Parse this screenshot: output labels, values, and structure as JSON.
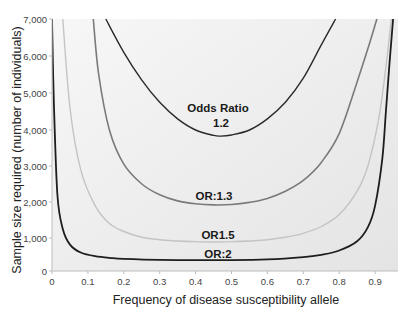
{
  "chart_data": {
    "type": "line",
    "title": "",
    "xlabel": "Frequency of disease susceptibility allele",
    "ylabel": "Sample size required (number of individuals)",
    "xlim": [
      0,
      1.0
    ],
    "ylim": [
      0,
      7000
    ],
    "x_ticks": [
      "0",
      "0.1",
      "0.2",
      "0.3",
      "0.4",
      "0.5",
      "0.6",
      "0.7",
      "0.8",
      "0.9"
    ],
    "y_ticks": [
      "0",
      "1,000",
      "2,000",
      "3,000",
      "4,000",
      "5,000",
      "6,000",
      "7,000"
    ],
    "grid": false,
    "legend": "inline labels",
    "background": "light gray gradient inside plot area",
    "series": [
      {
        "name": "Odds Ratio 1.2",
        "label_lines": [
          "Odds Ratio",
          "1.2"
        ],
        "color": "#2a2a2a",
        "x": [
          0.15,
          0.2,
          0.25,
          0.3,
          0.35,
          0.4,
          0.45,
          0.47,
          0.5,
          0.55,
          0.6,
          0.65,
          0.7,
          0.75,
          0.79
        ],
        "y": [
          7000,
          6100,
          5350,
          4750,
          4300,
          4000,
          3850,
          3830,
          3860,
          4000,
          4300,
          4750,
          5400,
          6300,
          7000
        ]
      },
      {
        "name": "OR:1.3",
        "label_lines": [
          "OR:1.3"
        ],
        "color": "#7a7a7a",
        "x": [
          0.115,
          0.13,
          0.16,
          0.2,
          0.25,
          0.3,
          0.35,
          0.4,
          0.45,
          0.5,
          0.55,
          0.6,
          0.65,
          0.7,
          0.75,
          0.8,
          0.85,
          0.88,
          0.905
        ],
        "y": [
          7000,
          5500,
          4000,
          3050,
          2500,
          2200,
          2030,
          1950,
          1920,
          1930,
          1990,
          2100,
          2300,
          2600,
          3100,
          3900,
          5300,
          6200,
          7000
        ]
      },
      {
        "name": "OR1.5",
        "label_lines": [
          "OR1.5"
        ],
        "color": "#c4c4c4",
        "x": [
          0.03,
          0.05,
          0.08,
          0.12,
          0.16,
          0.2,
          0.25,
          0.3,
          0.35,
          0.4,
          0.45,
          0.5,
          0.55,
          0.6,
          0.65,
          0.7,
          0.75,
          0.8,
          0.85,
          0.88,
          0.91,
          0.93,
          0.945
        ],
        "y": [
          7000,
          4600,
          2900,
          1900,
          1400,
          1180,
          1020,
          950,
          910,
          890,
          880,
          890,
          910,
          950,
          1020,
          1130,
          1320,
          1650,
          2300,
          3000,
          4300,
          5700,
          7000
        ]
      },
      {
        "name": "OR:2",
        "label_lines": [
          "OR:2"
        ],
        "color": "#1e1e1e",
        "x": [
          0.0,
          0.005,
          0.015,
          0.03,
          0.05,
          0.08,
          0.12,
          0.16,
          0.2,
          0.3,
          0.4,
          0.5,
          0.6,
          0.7,
          0.75,
          0.8,
          0.85,
          0.88,
          0.9,
          0.92,
          0.93,
          0.94,
          0.95
        ],
        "y": [
          7000,
          4800,
          2200,
          1250,
          800,
          560,
          450,
          400,
          370,
          340,
          330,
          330,
          350,
          420,
          490,
          620,
          900,
          1300,
          1900,
          3200,
          4500,
          5800,
          7000
        ]
      }
    ]
  },
  "labels": {
    "or12_line1": "Odds Ratio",
    "or12_line2": "1.2",
    "or13": "OR:1.3",
    "or15": "OR1.5",
    "or2": "OR:2",
    "xlabel": "Frequency of disease susceptibility allele",
    "ylabel": "Sample size required (number of individuals)"
  }
}
